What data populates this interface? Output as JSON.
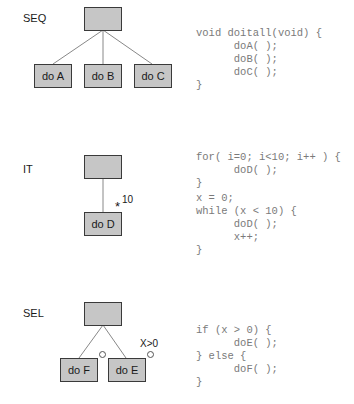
{
  "sections": {
    "seq": {
      "label": "SEQ",
      "children": [
        "do A",
        "do B",
        "do C"
      ],
      "code": [
        "void doitall(void) {",
        "      doA( );",
        "      doB( );",
        "      doC( );",
        "}"
      ]
    },
    "it": {
      "label": "IT",
      "child": "do D",
      "iteration_marker": "*",
      "iteration_count": "10",
      "code": [
        "for( i=0; i<10; i++ ) {",
        "      doD( );",
        "}",
        "x = 0;",
        "while (x < 10) {",
        "      doD( );",
        "      x++;",
        "}"
      ]
    },
    "sel": {
      "label": "SEL",
      "children": [
        "do F",
        "do E"
      ],
      "condition": "X>0",
      "code": [
        "if (x > 0) {",
        "      doE( );",
        "} else {",
        "      doF( );",
        "}"
      ]
    }
  },
  "colors": {
    "box_fill": "#c6c6c6",
    "box_border": "#3a3a3a",
    "line": "#888888",
    "code_text": "#7a7a7a"
  }
}
